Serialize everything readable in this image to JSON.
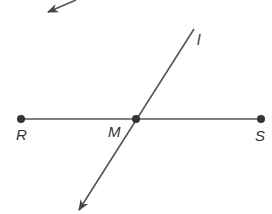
{
  "diagram": {
    "colors": {
      "stroke": "#555555",
      "point": "#333333",
      "label": "#333333",
      "background": "#ffffff"
    },
    "points": [
      {
        "id": "R",
        "label": "R",
        "x": 21,
        "y": 119
      },
      {
        "id": "M",
        "label": "M",
        "x": 136,
        "y": 119
      },
      {
        "id": "S",
        "label": "S",
        "x": 261,
        "y": 119
      }
    ],
    "segment": {
      "name": "RS",
      "from": "R",
      "to": "S"
    },
    "line": {
      "label": "l",
      "from": [
        194,
        29
      ],
      "to": [
        78,
        212
      ],
      "arrow_end": "bottom-left"
    },
    "partial_arrow": {
      "from": [
        76,
        0
      ],
      "to": [
        47,
        12
      ]
    }
  }
}
